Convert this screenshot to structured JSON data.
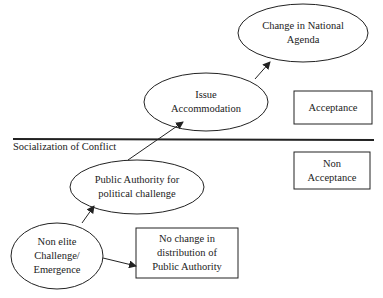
{
  "diagram": {
    "divider_label": "Socialization of Conflict",
    "nodes": {
      "change_national_agenda": {
        "shape": "ellipse",
        "lines": [
          "Change in National",
          "Agenda"
        ]
      },
      "issue_accommodation": {
        "shape": "ellipse",
        "lines": [
          "Issue",
          "Accommodation"
        ]
      },
      "acceptance": {
        "shape": "box",
        "lines": [
          "Acceptance"
        ]
      },
      "non_acceptance": {
        "shape": "box",
        "lines": [
          "Non",
          "Acceptance"
        ]
      },
      "public_authority": {
        "shape": "ellipse",
        "lines": [
          "Public Authority for",
          "political challenge"
        ]
      },
      "non_elite": {
        "shape": "ellipse",
        "lines": [
          "Non elite",
          "Challenge/",
          "Emergence"
        ]
      },
      "no_change": {
        "shape": "box",
        "lines": [
          "No change in",
          "distribution of",
          "Public Authority"
        ]
      }
    },
    "edges": [
      {
        "from": "non_elite",
        "to": "public_authority"
      },
      {
        "from": "non_elite",
        "to": "no_change"
      },
      {
        "from": "public_authority",
        "to": "issue_accommodation"
      },
      {
        "from": "issue_accommodation",
        "to": "change_national_agenda"
      }
    ],
    "colors": {
      "stroke": "#222222",
      "background": "#ffffff"
    }
  }
}
